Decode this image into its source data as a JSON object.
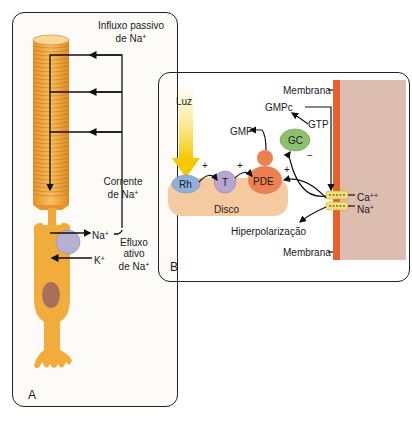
{
  "panel_a": {
    "letter": "A",
    "influx_label_1": "Influxo passivo",
    "influx_label_2": "de Na",
    "current_label_1": "Corrente",
    "current_label_2": "de Na",
    "efflux_label_1": "Efluxo",
    "efflux_label_2": "ativo",
    "efflux_label_3": "de Na",
    "na_label": "Na",
    "k_label": "K",
    "plus_sup": "+"
  },
  "panel_b": {
    "letter": "B",
    "light": "Luz",
    "rh": "Rh",
    "t": "T",
    "pde": "PDE",
    "gc": "GC",
    "disc": "Disco",
    "gmp": "GMP",
    "gmpc": "GMPc",
    "gtp": "GTP",
    "membrane_top": "Membrana",
    "membrane_bottom": "Membrana",
    "hyperpolarization": "Hiperpolarização",
    "ca": "Ca",
    "ca_sup": "++",
    "na": "Na",
    "na_sup": "+",
    "plus": "+",
    "minus": "−"
  },
  "colors": {
    "rod_orange": "#f0a83a",
    "membrane_orange": "#e8602c",
    "cytoplasm": "#d9b8ac",
    "disc": "#f6caa0",
    "rh": "#8fb0dc",
    "t": "#b8a6d0",
    "pde": "#ec8050",
    "gc": "#8fc070"
  }
}
